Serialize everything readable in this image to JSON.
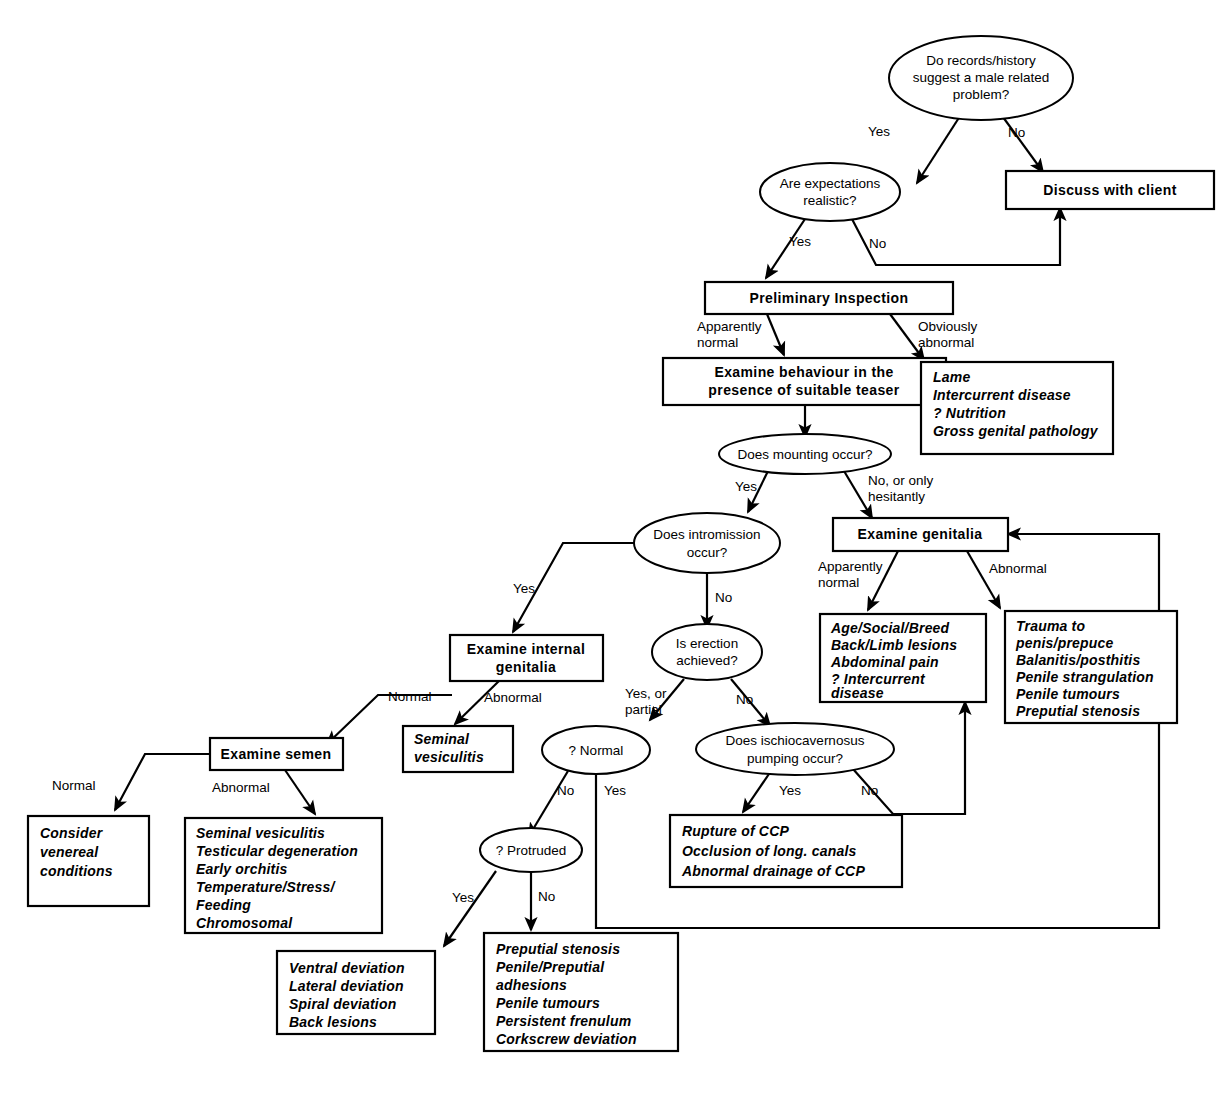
{
  "diagram": {
    "type": "flowchart",
    "background": "#ffffff",
    "line_color": "#000000",
    "nodes": [
      {
        "id": "q_records",
        "shape": "ellipse",
        "lines": [
          "Do records/history",
          "suggest a male related",
          "problem?"
        ]
      },
      {
        "id": "discuss",
        "shape": "box-bold",
        "lines": [
          "Discuss with client"
        ]
      },
      {
        "id": "q_expect",
        "shape": "ellipse",
        "lines": [
          "Are expectations",
          "realistic?"
        ]
      },
      {
        "id": "prelim",
        "shape": "box-bold",
        "lines": [
          "Preliminary Inspection"
        ]
      },
      {
        "id": "exam_behaviour",
        "shape": "box-bold",
        "lines": [
          "Examine behaviour in the",
          "presence of suitable teaser"
        ]
      },
      {
        "id": "list_obvious",
        "shape": "box-list",
        "lines": [
          "Lame",
          "Intercurrent disease",
          "? Nutrition",
          "Gross genital pathology"
        ]
      },
      {
        "id": "q_mounting",
        "shape": "ellipse",
        "lines": [
          "Does mounting occur?"
        ]
      },
      {
        "id": "exam_genitalia",
        "shape": "box-bold",
        "lines": [
          "Examine genitalia"
        ]
      },
      {
        "id": "q_intromission",
        "shape": "ellipse",
        "lines": [
          "Does intromission",
          "occur?"
        ]
      },
      {
        "id": "list_apparently",
        "shape": "box-list",
        "lines": [
          "Age/Social/Breed",
          "Back/Limb  lesions",
          "Abdominal  pain",
          "?  Intercurrent",
          "disease"
        ]
      },
      {
        "id": "list_abnormal_gen",
        "shape": "box-list",
        "lines": [
          "Trauma  to",
          "penis/prepuce",
          "Balanitis/posthitis",
          "Penile  strangulation",
          "Penile  tumours",
          "Preputial  stenosis"
        ]
      },
      {
        "id": "exam_internal",
        "shape": "box-bold",
        "lines": [
          "Examine internal",
          "genitalia"
        ]
      },
      {
        "id": "q_erection",
        "shape": "ellipse",
        "lines": [
          "Is erection",
          "achieved?"
        ]
      },
      {
        "id": "exam_semen",
        "shape": "box-bold",
        "lines": [
          "Examine semen"
        ]
      },
      {
        "id": "sem_ves",
        "shape": "box-list",
        "lines": [
          "Seminal",
          "vesiculitis"
        ]
      },
      {
        "id": "q_normal",
        "shape": "ellipse",
        "lines": [
          "? Normal"
        ]
      },
      {
        "id": "q_ischio",
        "shape": "ellipse",
        "lines": [
          "Does ischiocavernosus",
          "pumping occur?"
        ]
      },
      {
        "id": "list_venereal",
        "shape": "box-list",
        "lines": [
          "Consider",
          "venereal",
          "conditions"
        ]
      },
      {
        "id": "list_semen_abn",
        "shape": "box-list",
        "lines": [
          "Seminal  vesiculitis",
          "Testicular  degeneration",
          "Early  orchitis",
          "Temperature/Stress/",
          "Feeding",
          "Chromosomal"
        ]
      },
      {
        "id": "list_ccp",
        "shape": "box-list",
        "lines": [
          "Rupture  of  CCP",
          "Occlusion  of  long.  canals",
          "Abnormal  drainage  of  CCP"
        ]
      },
      {
        "id": "q_protruded",
        "shape": "ellipse",
        "lines": [
          "? Protruded"
        ]
      },
      {
        "id": "list_deviation",
        "shape": "box-list",
        "lines": [
          "Ventral  deviation",
          "Lateral  deviation",
          "Spiral  deviation",
          "Back  lesions"
        ]
      },
      {
        "id": "list_preputial",
        "shape": "box-list",
        "lines": [
          "Preputial  stenosis",
          "Penile/Preputial",
          "adhesions",
          "Penile  tumours",
          "Persistent  frenulum",
          "Corkscrew  deviation"
        ]
      }
    ],
    "edge_labels": [
      {
        "id": "e1",
        "text": "Yes",
        "from": "q_records",
        "to": "q_expect"
      },
      {
        "id": "e2",
        "text": "No",
        "from": "q_records",
        "to": "discuss"
      },
      {
        "id": "e3",
        "text": "Yes",
        "from": "q_expect",
        "to": "prelim"
      },
      {
        "id": "e4",
        "text": "No",
        "from": "q_expect",
        "to": "discuss"
      },
      {
        "id": "e5a",
        "text": "Apparently",
        "from": "prelim",
        "to": "exam_behaviour"
      },
      {
        "id": "e5b",
        "text": "normal",
        "from": "prelim",
        "to": "exam_behaviour"
      },
      {
        "id": "e6a",
        "text": "Obviously",
        "from": "prelim",
        "to": "list_obvious"
      },
      {
        "id": "e6b",
        "text": "abnormal",
        "from": "prelim",
        "to": "list_obvious"
      },
      {
        "id": "e7",
        "text": "Yes",
        "from": "q_mounting",
        "to": "q_intromission"
      },
      {
        "id": "e8a",
        "text": "No, or only",
        "from": "q_mounting",
        "to": "exam_genitalia"
      },
      {
        "id": "e8b",
        "text": "hesitantly",
        "from": "q_mounting",
        "to": "exam_genitalia"
      },
      {
        "id": "e9a",
        "text": "Apparently",
        "from": "exam_genitalia",
        "to": "list_apparently"
      },
      {
        "id": "e9b",
        "text": "normal",
        "from": "exam_genitalia",
        "to": "list_apparently"
      },
      {
        "id": "e10",
        "text": "Abnormal",
        "from": "exam_genitalia",
        "to": "list_abnormal_gen"
      },
      {
        "id": "e11",
        "text": "Yes",
        "from": "q_intromission",
        "to": "exam_internal"
      },
      {
        "id": "e12",
        "text": "No",
        "from": "q_intromission",
        "to": "q_erection"
      },
      {
        "id": "e13",
        "text": "Normal",
        "from": "exam_internal",
        "to": "exam_semen"
      },
      {
        "id": "e14",
        "text": "Abnormal",
        "from": "exam_internal",
        "to": "sem_ves"
      },
      {
        "id": "e15a",
        "text": "Yes, or",
        "from": "q_erection",
        "to": "q_normal"
      },
      {
        "id": "e15b",
        "text": "partial",
        "from": "q_erection",
        "to": "q_normal"
      },
      {
        "id": "e16",
        "text": "No",
        "from": "q_erection",
        "to": "q_ischio"
      },
      {
        "id": "e17",
        "text": "Normal",
        "from": "exam_semen",
        "to": "list_venereal"
      },
      {
        "id": "e18",
        "text": "Abnormal",
        "from": "exam_semen",
        "to": "list_semen_abn"
      },
      {
        "id": "e19",
        "text": "No",
        "from": "q_normal",
        "to": "q_protruded"
      },
      {
        "id": "e20",
        "text": "Yes",
        "from": "q_normal",
        "to": "exam_genitalia"
      },
      {
        "id": "e21",
        "text": "Yes",
        "from": "q_ischio",
        "to": "list_ccp"
      },
      {
        "id": "e22",
        "text": "No",
        "from": "q_ischio",
        "to": "list_apparently"
      },
      {
        "id": "e23",
        "text": "Yes",
        "from": "q_protruded",
        "to": "list_deviation"
      },
      {
        "id": "e24",
        "text": "No",
        "from": "q_protruded",
        "to": "list_preputial"
      }
    ]
  }
}
